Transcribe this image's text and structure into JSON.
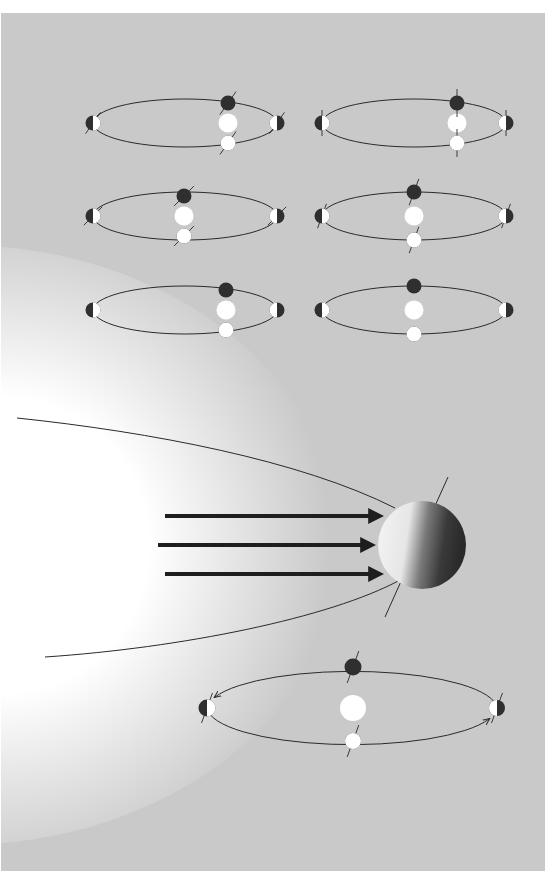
{
  "figure": {
    "colors": {
      "background": "#c9c9c9",
      "sunlight_glow": "#ffffff",
      "ray_arrow": "#1e1e1e",
      "orbit_line": "#2a2a2a",
      "planet_dark": "#2f2f2f",
      "planet_light": "#ffffff",
      "sun": "#ffffff"
    }
  },
  "small_orbits": [
    {
      "id": "orbit-top-left",
      "row": 1,
      "col": 1,
      "axis_tilt_deg": 35,
      "planet_column": "right"
    },
    {
      "id": "orbit-top-right",
      "row": 1,
      "col": 2,
      "axis_tilt_deg": 0,
      "planet_column": "right"
    },
    {
      "id": "orbit-middle-left",
      "row": 2,
      "col": 1,
      "axis_tilt_deg": 45,
      "planet_column": "center"
    },
    {
      "id": "orbit-middle-right",
      "row": 2,
      "col": 2,
      "axis_tilt_deg": 20,
      "planet_column": "center"
    },
    {
      "id": "orbit-bottom-left",
      "row": 3,
      "col": 1,
      "axis_tilt_deg": null,
      "planet_column": "right"
    },
    {
      "id": "orbit-bottom-right",
      "row": 3,
      "col": 2,
      "axis_tilt_deg": null,
      "planet_column": "center"
    }
  ],
  "sunlight": {
    "ray_count": 3,
    "direction": "left-to-right",
    "planet_axis_tilt_deg": 24
  },
  "large_orbit": {
    "axis_tilt_deg": 20,
    "direction_arrows": [
      "left-downward",
      "right-upward"
    ]
  }
}
